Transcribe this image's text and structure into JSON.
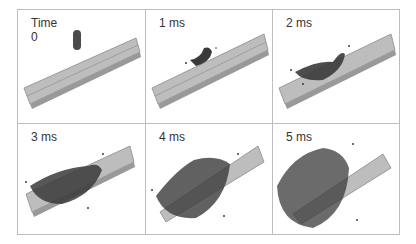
{
  "figure": {
    "panels": [
      {
        "label": "Time\n0",
        "time_ms": 0
      },
      {
        "label": "1 ms",
        "time_ms": 1
      },
      {
        "label": "2 ms",
        "time_ms": 2
      },
      {
        "label": "3 ms",
        "time_ms": 3
      },
      {
        "label": "4 ms",
        "time_ms": 4
      },
      {
        "label": "5 ms",
        "time_ms": 5
      }
    ],
    "colors": {
      "border": "#bdbdbd",
      "plate": "#b5b5b5",
      "plate_edge": "#8a8a8a",
      "particles": "#3a3a3a",
      "projectile": "#4a4a4a"
    }
  }
}
